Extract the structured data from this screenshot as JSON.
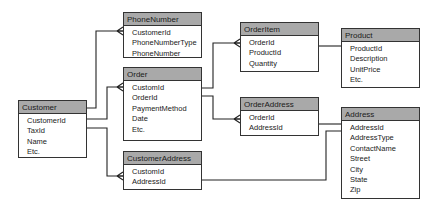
{
  "entities": {
    "customer": {
      "name": "Customer",
      "fields": [
        "CustomerId",
        "TaxId",
        "Name",
        "Etc."
      ]
    },
    "phone_number": {
      "name": "PhoneNumber",
      "fields": [
        "CustomerId",
        "PhoneNumberType",
        "PhoneNumber"
      ]
    },
    "order": {
      "name": "Order",
      "fields": [
        "CustomId",
        "OrderId",
        "PaymentMethod",
        "Date",
        "Etc."
      ]
    },
    "customer_address": {
      "name": "CustomerAddress",
      "fields": [
        "CustomId",
        "AddressId"
      ]
    },
    "order_item": {
      "name": "OrderItem",
      "fields": [
        "OrderId",
        "ProductId",
        "Quantity"
      ]
    },
    "product": {
      "name": "Product",
      "fields": [
        "ProductId",
        "Description",
        "UnitPrice",
        "Etc."
      ]
    },
    "order_address": {
      "name": "OrderAddress",
      "fields": [
        "OrderId",
        "AddressId"
      ]
    },
    "address": {
      "name": "Address",
      "fields": [
        "AddressId",
        "AddressType",
        "ContactName",
        "Street",
        "City",
        "State",
        "Zip"
      ]
    }
  },
  "relationships": [
    {
      "from": "Customer",
      "to": "PhoneNumber",
      "type": "one-to-many"
    },
    {
      "from": "Customer",
      "to": "Order",
      "type": "one-to-many"
    },
    {
      "from": "Customer",
      "to": "CustomerAddress",
      "type": "one-to-many"
    },
    {
      "from": "Order",
      "to": "OrderItem",
      "type": "one-to-many"
    },
    {
      "from": "Order",
      "to": "OrderAddress",
      "type": "one-to-many"
    },
    {
      "from": "Product",
      "to": "OrderItem",
      "type": "one-to-many"
    },
    {
      "from": "Address",
      "to": "OrderAddress",
      "type": "one-to-many"
    },
    {
      "from": "Address",
      "to": "CustomerAddress",
      "type": "one-to-many"
    }
  ],
  "colors": {
    "header_fill": "#a9a9a9",
    "border": "#333333",
    "line": "#222222"
  }
}
